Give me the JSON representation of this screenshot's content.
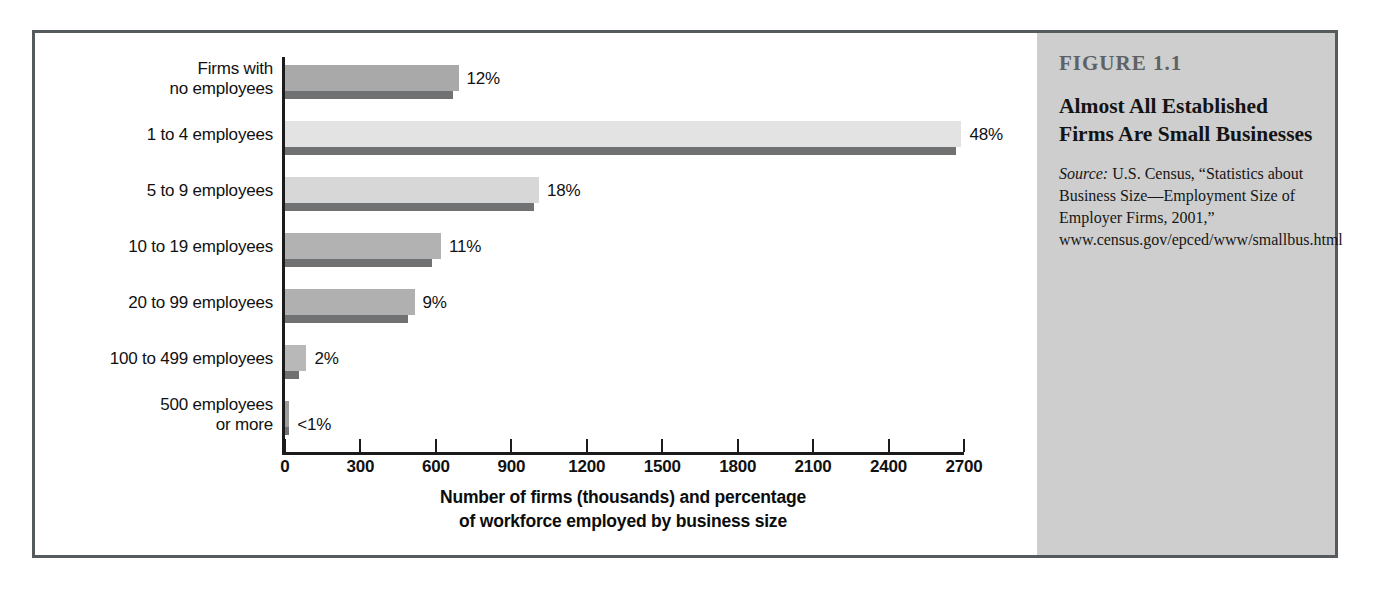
{
  "figure": {
    "number_label": "FIGURE 1.1",
    "title": "Almost All Established Firms Are Small Businesses",
    "source_word": "Source:",
    "source_text": " U.S. Census, “Statistics about Business Size—Employment Size of Employer Firms, 2001,” www.census.gov/epced/www/smallbus.html"
  },
  "colors": {
    "frame_border": "#555a5c",
    "caption_background": "#cecece",
    "axis": "#1b1b1b",
    "pct_bar": "#6f7173",
    "bar_shades": [
      "#a9a9a9",
      "#e3e3e3",
      "#d7d7d7",
      "#b2b2b2",
      "#b0b0b0",
      "#b8b8b8",
      "#9c9c9c"
    ]
  },
  "chart_data": {
    "type": "bar",
    "orientation": "horizontal",
    "title": "Almost All Established Firms Are Small Businesses",
    "xlabel": "Number of firms (thousands) and percentage of workforce employed by business size",
    "xlabel_line1": "Number of firms (thousands) and percentage",
    "xlabel_line2": "of workforce employed by business size",
    "ylabel": "",
    "xlim": [
      0,
      2700
    ],
    "xticks": [
      0,
      300,
      600,
      900,
      1200,
      1500,
      1800,
      2100,
      2400,
      2700
    ],
    "xtick_labels": [
      "0",
      "300",
      "600",
      "900",
      "1200",
      "1500",
      "1800",
      "2100",
      "2400",
      "2700"
    ],
    "grid": false,
    "legend": "none",
    "categories": [
      "Firms with no employees",
      "1 to 4 employees",
      "5 to 9 employees",
      "10 to 19 employees",
      "20 to 99 employees",
      "100 to 499 employees",
      "500 employees or more"
    ],
    "category_lines": [
      [
        "Firms with",
        "no employees"
      ],
      [
        "1 to 4 employees"
      ],
      [
        "5 to 9 employees"
      ],
      [
        "10 to 19 employees"
      ],
      [
        "20 to 99 employees"
      ],
      [
        "100 to 499 employees"
      ],
      [
        "500 employees",
        "or more"
      ]
    ],
    "series": [
      {
        "name": "Number of firms (thousands)",
        "values": [
          690,
          2690,
          1010,
          620,
          515,
          85,
          17
        ]
      },
      {
        "name": "Percentage of workforce employed",
        "unit": "%",
        "values": [
          12,
          48,
          18,
          11,
          9,
          2,
          0.5
        ],
        "labels": [
          "12%",
          "48%",
          "18%",
          "11%",
          "9%",
          "2%",
          "<1%"
        ],
        "bar_scaled_values": [
          670,
          2670,
          990,
          585,
          490,
          55,
          14
        ]
      }
    ]
  }
}
